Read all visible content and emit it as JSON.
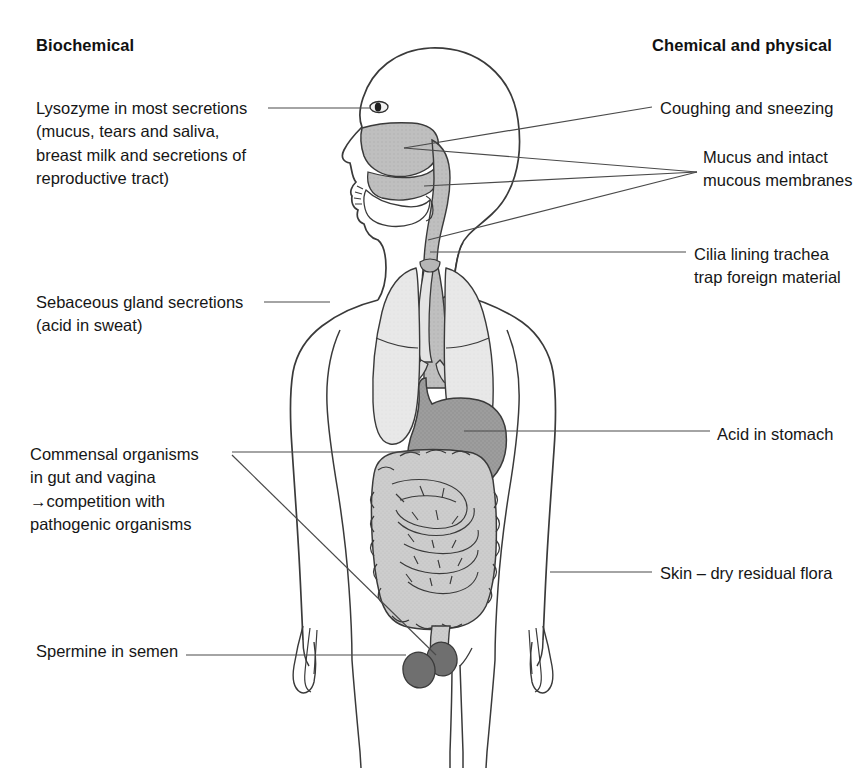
{
  "figure": {
    "title_left": "Biochemical",
    "title_right": "Chemical and physical",
    "colors": {
      "outline": "#3a3a3a",
      "leader_line": "#4a4a4a",
      "lung_fill": "#e6e6e6",
      "airway_fill": "#bdbdbd",
      "stomach_fill": "#9a9a9a",
      "intestine_fill": "#c9c9c9",
      "gonad_fill": "#6f6f6f",
      "nasal_fill": "#b4b4b4",
      "background": "#ffffff",
      "text": "#161616"
    }
  },
  "labels": {
    "biochemical": {
      "lysozyme": "Lysozyme in most secretions\n(mucus, tears and saliva,\nbreast milk and secretions of\nreproductive tract)",
      "sebaceous": "Sebaceous gland secretions\n(acid in sweat)",
      "commensal": "Commensal organisms\nin gut and vagina\n→competition with\npathogenic organisms",
      "spermine": "Spermine in semen"
    },
    "chemical_physical": {
      "coughing": "Coughing and sneezing",
      "mucus": "Mucus and intact\nmucous membranes",
      "cilia": "Cilia lining trachea\ntrap foreign material",
      "acid": "Acid in stomach",
      "skin": "Skin – dry residual flora"
    }
  },
  "anatomy_parts": [
    "head-profile",
    "eye",
    "nasal-cavity",
    "oral-cavity-tongue",
    "pharynx",
    "trachea",
    "oesophagus",
    "left-lung",
    "right-lung",
    "stomach",
    "small-intestine",
    "large-intestine",
    "rectum",
    "gonads",
    "torso-outline",
    "arms",
    "hands",
    "legs"
  ]
}
